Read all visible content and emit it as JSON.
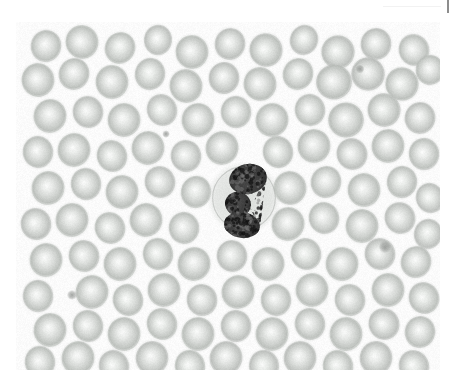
{
  "image": {
    "kind": "micrograph",
    "modality": "light-microscopy",
    "specimen": "peripheral-blood-smear",
    "stain_appearance": "desaturated-grayscale",
    "frame": {
      "x": 16,
      "y": 22,
      "width": 424,
      "height": 348
    },
    "background_color": "#fbfbfb",
    "page_background_color": "#ffffff"
  },
  "top_marker": {
    "rule_color": "#f2f2f2",
    "tick_color": "#8d8d8d",
    "tick_label": ""
  },
  "palette": {
    "background": "#fbfbfb",
    "rbc_rim": "#c9ccc9",
    "rbc_body": "#d8dbd8",
    "rbc_pallor": "#f0f2f0",
    "rbc_dark_rim": "#b4b8b4",
    "wbc_cytoplasm": "#d2d6d2",
    "wbc_nucleus": "#4a4a4a",
    "wbc_nucleus_dark": "#2e2e2e",
    "platelet": "#9a9d9a"
  },
  "chart_data": {
    "type": "scatter",
    "title": "",
    "xlabel": "",
    "ylabel": "",
    "note": "Cell positions within the micrograph frame, in frame-local pixels (424x348).",
    "white_blood_cells": [
      {
        "name": "segmented-neutrophil",
        "cx": 228,
        "cy": 176,
        "r": 33,
        "cyto_r": 33,
        "lobes": [
          {
            "cx": 232,
            "cy": 157,
            "rx": 19,
            "ry": 15,
            "rot": -12
          },
          {
            "cx": 222,
            "cy": 182,
            "rx": 13,
            "ry": 12,
            "rot": 20
          },
          {
            "cx": 226,
            "cy": 203,
            "rx": 18,
            "ry": 13,
            "rot": 8
          }
        ]
      }
    ],
    "platelets": [
      {
        "cx": 56,
        "cy": 273,
        "r": 3.4
      },
      {
        "cx": 369,
        "cy": 225,
        "r": 4.2
      },
      {
        "cx": 344,
        "cy": 47,
        "r": 3.0
      },
      {
        "cx": 150,
        "cy": 112,
        "r": 2.6
      }
    ],
    "red_blood_cells": [
      {
        "cx": 30,
        "cy": 24,
        "r": 16,
        "t": 0.95,
        "rot": 12
      },
      {
        "cx": 66,
        "cy": 20,
        "r": 17,
        "t": 1.0,
        "rot": -20
      },
      {
        "cx": 104,
        "cy": 26,
        "r": 16,
        "t": 0.92,
        "rot": 30
      },
      {
        "cx": 142,
        "cy": 18,
        "r": 15,
        "t": 0.88,
        "rot": 5
      },
      {
        "cx": 176,
        "cy": 30,
        "r": 17,
        "t": 1.0,
        "rot": -8
      },
      {
        "cx": 214,
        "cy": 22,
        "r": 16,
        "t": 0.96,
        "rot": 18
      },
      {
        "cx": 250,
        "cy": 28,
        "r": 17,
        "t": 1.02,
        "rot": -30
      },
      {
        "cx": 288,
        "cy": 18,
        "r": 15,
        "t": 0.9,
        "rot": 22
      },
      {
        "cx": 322,
        "cy": 30,
        "r": 17,
        "t": 1.05,
        "rot": -15
      },
      {
        "cx": 360,
        "cy": 22,
        "r": 16,
        "t": 0.98,
        "rot": 9
      },
      {
        "cx": 398,
        "cy": 28,
        "r": 16,
        "t": 0.94,
        "rot": -25
      },
      {
        "cx": 22,
        "cy": 58,
        "r": 17,
        "t": 1.0,
        "rot": -10
      },
      {
        "cx": 58,
        "cy": 52,
        "r": 16,
        "t": 0.95,
        "rot": 25
      },
      {
        "cx": 96,
        "cy": 60,
        "r": 17,
        "t": 1.0,
        "rot": -5
      },
      {
        "cx": 134,
        "cy": 52,
        "r": 16,
        "t": 0.93,
        "rot": 14
      },
      {
        "cx": 170,
        "cy": 64,
        "r": 17,
        "t": 1.0,
        "rot": -22
      },
      {
        "cx": 208,
        "cy": 56,
        "r": 16,
        "t": 0.97,
        "rot": 6
      },
      {
        "cx": 244,
        "cy": 62,
        "r": 17,
        "t": 1.0,
        "rot": -18
      },
      {
        "cx": 282,
        "cy": 52,
        "r": 16,
        "t": 0.92,
        "rot": 28
      },
      {
        "cx": 318,
        "cy": 60,
        "r": 18,
        "t": 1.12,
        "rot": -12
      },
      {
        "cx": 352,
        "cy": 52,
        "r": 17,
        "t": 1.08,
        "rot": 16
      },
      {
        "cx": 386,
        "cy": 62,
        "r": 17,
        "t": 1.04,
        "rot": -28
      },
      {
        "cx": 414,
        "cy": 48,
        "r": 15,
        "t": 0.95,
        "rot": 10
      },
      {
        "cx": 34,
        "cy": 94,
        "r": 17,
        "t": 1.0,
        "rot": 20
      },
      {
        "cx": 72,
        "cy": 90,
        "r": 16,
        "t": 0.96,
        "rot": -14
      },
      {
        "cx": 108,
        "cy": 98,
        "r": 17,
        "t": 1.0,
        "rot": 8
      },
      {
        "cx": 146,
        "cy": 88,
        "r": 16,
        "t": 0.9,
        "rot": -26
      },
      {
        "cx": 182,
        "cy": 98,
        "r": 17,
        "t": 1.0,
        "rot": 12
      },
      {
        "cx": 220,
        "cy": 90,
        "r": 16,
        "t": 0.95,
        "rot": -6
      },
      {
        "cx": 256,
        "cy": 98,
        "r": 17,
        "t": 1.0,
        "rot": 24
      },
      {
        "cx": 294,
        "cy": 88,
        "r": 16,
        "t": 0.94,
        "rot": -16
      },
      {
        "cx": 330,
        "cy": 98,
        "r": 18,
        "t": 1.1,
        "rot": 4
      },
      {
        "cx": 368,
        "cy": 88,
        "r": 17,
        "t": 1.02,
        "rot": -20
      },
      {
        "cx": 404,
        "cy": 96,
        "r": 16,
        "t": 0.98,
        "rot": 14
      },
      {
        "cx": 22,
        "cy": 130,
        "r": 16,
        "t": 0.95,
        "rot": -8
      },
      {
        "cx": 58,
        "cy": 128,
        "r": 17,
        "t": 1.0,
        "rot": 18
      },
      {
        "cx": 96,
        "cy": 134,
        "r": 16,
        "t": 0.92,
        "rot": -24
      },
      {
        "cx": 132,
        "cy": 126,
        "r": 17,
        "t": 1.0,
        "rot": 10
      },
      {
        "cx": 170,
        "cy": 134,
        "r": 16,
        "t": 0.96,
        "rot": -12
      },
      {
        "cx": 206,
        "cy": 126,
        "r": 17,
        "t": 1.0,
        "rot": 26
      },
      {
        "cx": 262,
        "cy": 130,
        "r": 16,
        "t": 0.93,
        "rot": -18
      },
      {
        "cx": 298,
        "cy": 124,
        "r": 17,
        "t": 1.0,
        "rot": 6
      },
      {
        "cx": 336,
        "cy": 132,
        "r": 16,
        "t": 0.97,
        "rot": -28
      },
      {
        "cx": 372,
        "cy": 124,
        "r": 17,
        "t": 1.0,
        "rot": 16
      },
      {
        "cx": 408,
        "cy": 132,
        "r": 16,
        "t": 0.95,
        "rot": -4
      },
      {
        "cx": 32,
        "cy": 166,
        "r": 17,
        "t": 1.0,
        "rot": 22
      },
      {
        "cx": 70,
        "cy": 162,
        "r": 16,
        "t": 0.94,
        "rot": -10
      },
      {
        "cx": 106,
        "cy": 170,
        "r": 17,
        "t": 1.0,
        "rot": 8
      },
      {
        "cx": 144,
        "cy": 160,
        "r": 16,
        "t": 0.96,
        "rot": -22
      },
      {
        "cx": 180,
        "cy": 170,
        "r": 16,
        "t": 0.92,
        "rot": 14
      },
      {
        "cx": 274,
        "cy": 166,
        "r": 17,
        "t": 1.0,
        "rot": -16
      },
      {
        "cx": 310,
        "cy": 160,
        "r": 16,
        "t": 0.95,
        "rot": 20
      },
      {
        "cx": 348,
        "cy": 168,
        "r": 17,
        "t": 1.0,
        "rot": -6
      },
      {
        "cx": 386,
        "cy": 160,
        "r": 16,
        "t": 0.93,
        "rot": 12
      },
      {
        "cx": 414,
        "cy": 176,
        "r": 15,
        "t": 0.9,
        "rot": -20
      },
      {
        "cx": 20,
        "cy": 202,
        "r": 16,
        "t": 0.96,
        "rot": -14
      },
      {
        "cx": 56,
        "cy": 198,
        "r": 17,
        "t": 1.0,
        "rot": 18
      },
      {
        "cx": 94,
        "cy": 206,
        "r": 16,
        "t": 0.92,
        "rot": -26
      },
      {
        "cx": 130,
        "cy": 198,
        "r": 17,
        "t": 1.0,
        "rot": 10
      },
      {
        "cx": 168,
        "cy": 206,
        "r": 16,
        "t": 0.95,
        "rot": -8
      },
      {
        "cx": 272,
        "cy": 202,
        "r": 17,
        "t": 1.0,
        "rot": 24
      },
      {
        "cx": 308,
        "cy": 196,
        "r": 16,
        "t": 0.94,
        "rot": -18
      },
      {
        "cx": 346,
        "cy": 204,
        "r": 17,
        "t": 1.0,
        "rot": 6
      },
      {
        "cx": 384,
        "cy": 196,
        "r": 16,
        "t": 0.96,
        "rot": -28
      },
      {
        "cx": 412,
        "cy": 212,
        "r": 15,
        "t": 0.9,
        "rot": 16
      },
      {
        "cx": 30,
        "cy": 238,
        "r": 17,
        "t": 1.0,
        "rot": 12
      },
      {
        "cx": 68,
        "cy": 234,
        "r": 16,
        "t": 0.95,
        "rot": -20
      },
      {
        "cx": 104,
        "cy": 242,
        "r": 17,
        "t": 1.0,
        "rot": 4
      },
      {
        "cx": 142,
        "cy": 232,
        "r": 16,
        "t": 0.92,
        "rot": -14
      },
      {
        "cx": 178,
        "cy": 242,
        "r": 17,
        "t": 1.0,
        "rot": 22
      },
      {
        "cx": 216,
        "cy": 234,
        "r": 16,
        "t": 0.96,
        "rot": -10
      },
      {
        "cx": 252,
        "cy": 242,
        "r": 17,
        "t": 1.0,
        "rot": 18
      },
      {
        "cx": 290,
        "cy": 232,
        "r": 16,
        "t": 0.93,
        "rot": -24
      },
      {
        "cx": 326,
        "cy": 242,
        "r": 17,
        "t": 1.0,
        "rot": 8
      },
      {
        "cx": 364,
        "cy": 232,
        "r": 16,
        "t": 0.97,
        "rot": -16
      },
      {
        "cx": 400,
        "cy": 240,
        "r": 16,
        "t": 0.95,
        "rot": 20
      },
      {
        "cx": 22,
        "cy": 274,
        "r": 16,
        "t": 0.94,
        "rot": -6
      },
      {
        "cx": 76,
        "cy": 270,
        "r": 17,
        "t": 1.0,
        "rot": 16
      },
      {
        "cx": 112,
        "cy": 278,
        "r": 16,
        "t": 0.92,
        "rot": -22
      },
      {
        "cx": 148,
        "cy": 268,
        "r": 17,
        "t": 1.0,
        "rot": 10
      },
      {
        "cx": 186,
        "cy": 278,
        "r": 16,
        "t": 0.96,
        "rot": -12
      },
      {
        "cx": 222,
        "cy": 270,
        "r": 17,
        "t": 1.0,
        "rot": 26
      },
      {
        "cx": 260,
        "cy": 278,
        "r": 16,
        "t": 0.94,
        "rot": -8
      },
      {
        "cx": 296,
        "cy": 268,
        "r": 17,
        "t": 1.0,
        "rot": 14
      },
      {
        "cx": 334,
        "cy": 278,
        "r": 16,
        "t": 0.95,
        "rot": -20
      },
      {
        "cx": 372,
        "cy": 268,
        "r": 17,
        "t": 1.0,
        "rot": 6
      },
      {
        "cx": 408,
        "cy": 276,
        "r": 16,
        "t": 0.93,
        "rot": -26
      },
      {
        "cx": 34,
        "cy": 308,
        "r": 17,
        "t": 1.0,
        "rot": 18
      },
      {
        "cx": 72,
        "cy": 304,
        "r": 16,
        "t": 0.95,
        "rot": -14
      },
      {
        "cx": 108,
        "cy": 312,
        "r": 17,
        "t": 1.0,
        "rot": 8
      },
      {
        "cx": 146,
        "cy": 302,
        "r": 16,
        "t": 0.92,
        "rot": -24
      },
      {
        "cx": 182,
        "cy": 312,
        "r": 17,
        "t": 1.0,
        "rot": 12
      },
      {
        "cx": 220,
        "cy": 304,
        "r": 16,
        "t": 0.96,
        "rot": -6
      },
      {
        "cx": 256,
        "cy": 312,
        "r": 17,
        "t": 1.0,
        "rot": 22
      },
      {
        "cx": 294,
        "cy": 302,
        "r": 16,
        "t": 0.94,
        "rot": -18
      },
      {
        "cx": 330,
        "cy": 312,
        "r": 17,
        "t": 1.0,
        "rot": 4
      },
      {
        "cx": 368,
        "cy": 302,
        "r": 16,
        "t": 0.97,
        "rot": -28
      },
      {
        "cx": 404,
        "cy": 310,
        "r": 16,
        "t": 0.95,
        "rot": 16
      },
      {
        "cx": 24,
        "cy": 340,
        "r": 16,
        "t": 0.94,
        "rot": -10
      },
      {
        "cx": 62,
        "cy": 336,
        "r": 17,
        "t": 1.0,
        "rot": 20
      },
      {
        "cx": 98,
        "cy": 344,
        "r": 16,
        "t": 0.9,
        "rot": -22
      },
      {
        "cx": 136,
        "cy": 336,
        "r": 17,
        "t": 0.98,
        "rot": 10
      },
      {
        "cx": 174,
        "cy": 344,
        "r": 16,
        "t": 0.92,
        "rot": -14
      },
      {
        "cx": 210,
        "cy": 336,
        "r": 17,
        "t": 0.98,
        "rot": 24
      },
      {
        "cx": 248,
        "cy": 344,
        "r": 16,
        "t": 0.9,
        "rot": -8
      },
      {
        "cx": 284,
        "cy": 336,
        "r": 17,
        "t": 0.98,
        "rot": 14
      },
      {
        "cx": 322,
        "cy": 344,
        "r": 16,
        "t": 0.92,
        "rot": -20
      },
      {
        "cx": 360,
        "cy": 336,
        "r": 17,
        "t": 0.98,
        "rot": 6
      },
      {
        "cx": 398,
        "cy": 344,
        "r": 16,
        "t": 0.9,
        "rot": -26
      }
    ]
  }
}
